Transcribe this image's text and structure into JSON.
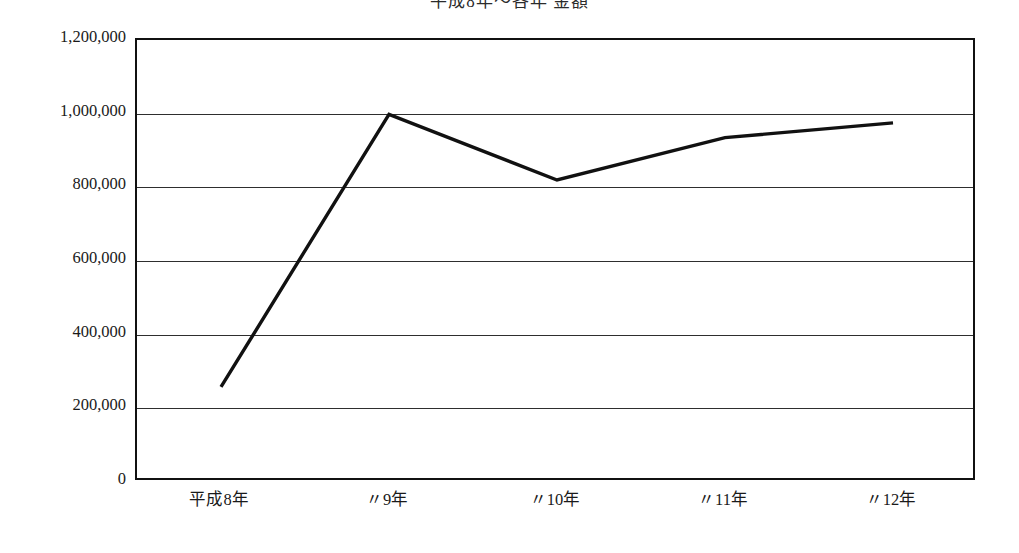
{
  "chart_data": {
    "type": "line",
    "title": "平成8年〜各年 金額",
    "xlabel": "",
    "ylabel": "",
    "categories": [
      "平成8年",
      "〃9年",
      "〃10年",
      "〃11年",
      "〃12年"
    ],
    "series": [
      {
        "name": "金額",
        "values": [
          258000,
          998000,
          820000,
          935000,
          975000
        ]
      }
    ],
    "ylim": [
      0,
      1200000
    ],
    "ytick_labels": [
      "1,200,000",
      "1,000,000",
      "800,000",
      "600,000",
      "400,000",
      "200,000",
      "0"
    ],
    "ytick_values": [
      1200000,
      1000000,
      800000,
      600000,
      400000,
      200000,
      0
    ],
    "grid": true,
    "grid_axis": "y",
    "legend": false,
    "legend_position": "none",
    "line_color": "#111111",
    "line_width": 3.4,
    "markers": false,
    "frame_color": "#111111",
    "background_color": "#ffffff",
    "annotations": []
  },
  "figure": {
    "plot_left_px": 135,
    "plot_top_px": 38,
    "plot_width_px": 840,
    "plot_height_px": 442
  }
}
